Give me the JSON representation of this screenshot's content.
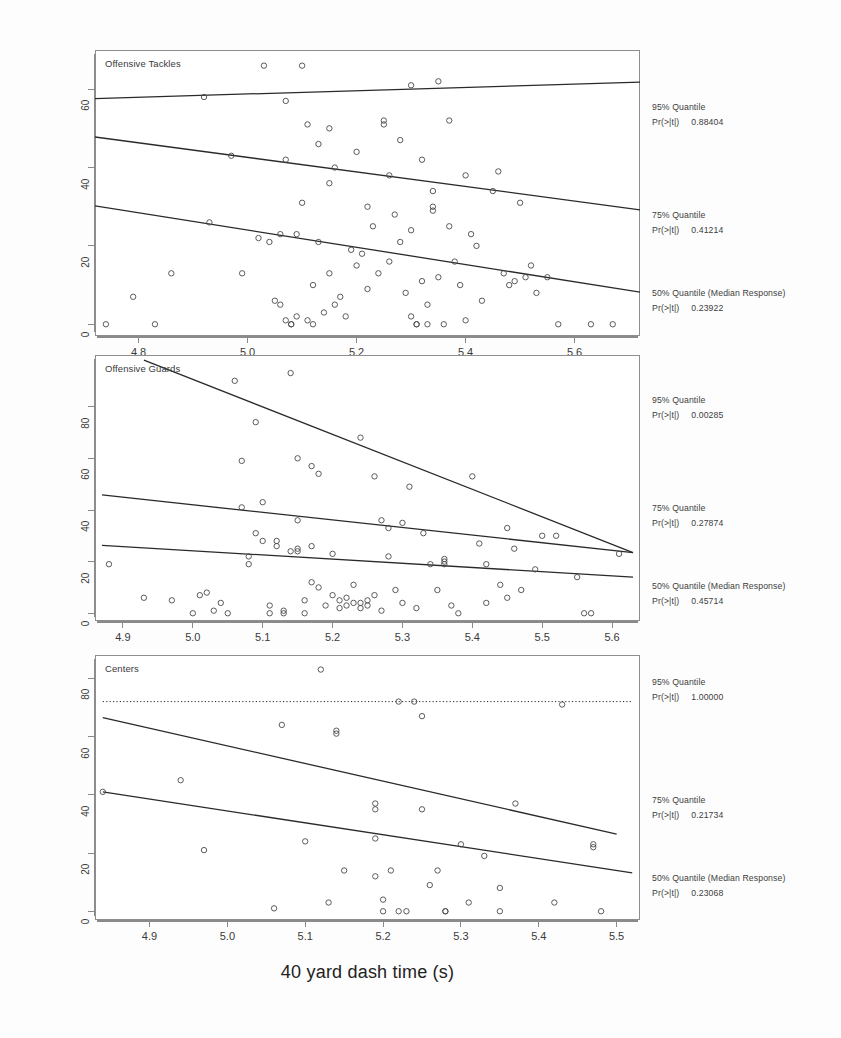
{
  "figure": {
    "xlabel": "40 yard dash time (s)",
    "ylabel": "Career Approximate Value"
  },
  "chart_data": [
    {
      "type": "scatter",
      "title": "Offensive Tackles",
      "xlabel": "40 yard dash time (s)",
      "ylabel": "Career Approximate Value",
      "xlim": [
        4.72,
        5.72
      ],
      "ylim": [
        -3,
        70
      ],
      "xticks": [
        4.8,
        5.0,
        5.2,
        5.4,
        5.6
      ],
      "yticks": [
        0,
        20,
        40,
        60
      ],
      "grid": false,
      "marker": "open-circle",
      "points": [
        [
          4.74,
          0
        ],
        [
          4.79,
          7
        ],
        [
          4.83,
          0
        ],
        [
          4.86,
          13
        ],
        [
          4.92,
          58
        ],
        [
          4.93,
          26
        ],
        [
          4.97,
          43
        ],
        [
          4.99,
          13
        ],
        [
          5.02,
          22
        ],
        [
          5.03,
          66
        ],
        [
          5.04,
          21
        ],
        [
          5.05,
          6
        ],
        [
          5.06,
          5
        ],
        [
          5.06,
          23
        ],
        [
          5.07,
          57
        ],
        [
          5.07,
          42
        ],
        [
          5.07,
          1
        ],
        [
          5.08,
          0
        ],
        [
          5.08,
          0
        ],
        [
          5.09,
          23
        ],
        [
          5.09,
          2
        ],
        [
          5.1,
          66
        ],
        [
          5.1,
          31
        ],
        [
          5.11,
          51
        ],
        [
          5.11,
          1
        ],
        [
          5.12,
          10
        ],
        [
          5.12,
          0
        ],
        [
          5.13,
          46
        ],
        [
          5.13,
          21
        ],
        [
          5.14,
          3
        ],
        [
          5.15,
          50
        ],
        [
          5.15,
          36
        ],
        [
          5.15,
          13
        ],
        [
          5.16,
          40
        ],
        [
          5.16,
          5
        ],
        [
          5.17,
          7
        ],
        [
          5.18,
          2
        ],
        [
          5.19,
          19
        ],
        [
          5.2,
          44
        ],
        [
          5.2,
          15
        ],
        [
          5.21,
          18
        ],
        [
          5.22,
          30
        ],
        [
          5.22,
          9
        ],
        [
          5.23,
          25
        ],
        [
          5.24,
          13
        ],
        [
          5.25,
          52
        ],
        [
          5.25,
          51
        ],
        [
          5.26,
          38
        ],
        [
          5.26,
          16
        ],
        [
          5.27,
          28
        ],
        [
          5.28,
          47
        ],
        [
          5.28,
          21
        ],
        [
          5.29,
          8
        ],
        [
          5.3,
          61
        ],
        [
          5.3,
          24
        ],
        [
          5.3,
          2
        ],
        [
          5.31,
          0
        ],
        [
          5.31,
          0
        ],
        [
          5.32,
          42
        ],
        [
          5.32,
          11
        ],
        [
          5.33,
          5
        ],
        [
          5.33,
          0
        ],
        [
          5.34,
          34
        ],
        [
          5.34,
          30
        ],
        [
          5.34,
          29
        ],
        [
          5.35,
          62
        ],
        [
          5.35,
          12
        ],
        [
          5.36,
          0
        ],
        [
          5.37,
          52
        ],
        [
          5.37,
          25
        ],
        [
          5.38,
          16
        ],
        [
          5.39,
          10
        ],
        [
          5.4,
          38
        ],
        [
          5.4,
          1
        ],
        [
          5.41,
          23
        ],
        [
          5.42,
          20
        ],
        [
          5.43,
          6
        ],
        [
          5.45,
          34
        ],
        [
          5.46,
          39
        ],
        [
          5.47,
          13
        ],
        [
          5.48,
          10
        ],
        [
          5.49,
          11
        ],
        [
          5.5,
          31
        ],
        [
          5.51,
          12
        ],
        [
          5.52,
          15
        ],
        [
          5.53,
          8
        ],
        [
          5.55,
          12
        ],
        [
          5.57,
          0
        ],
        [
          5.63,
          0
        ],
        [
          5.67,
          0
        ]
      ],
      "fits": [
        {
          "name": "95% Quantile",
          "x0": 4.72,
          "y0": 57.6,
          "x1": 5.72,
          "y1": 61.8,
          "style": "solid"
        },
        {
          "name": "75% Quantile",
          "x0": 4.72,
          "y0": 47.8,
          "x1": 5.72,
          "y1": 29.2,
          "style": "solid"
        },
        {
          "name": "50% Quantile (Median Response)",
          "x0": 4.72,
          "y0": 30.2,
          "x1": 5.72,
          "y1": 8.2,
          "style": "solid"
        }
      ],
      "annotations": [
        {
          "quantile": "95% Quantile",
          "stat_label": "Pr(>|t|)",
          "p_value": "0.88404"
        },
        {
          "quantile": "75% Quantile",
          "stat_label": "Pr(>|t|)",
          "p_value": "0.41214"
        },
        {
          "quantile": "50% Quantile (Median Response)",
          "stat_label": "Pr(>|t|)",
          "p_value": "0.23922"
        }
      ]
    },
    {
      "type": "scatter",
      "title": "Offensive Guards",
      "xlabel": "40 yard dash time (s)",
      "ylabel": "Career Approximate Value",
      "xlim": [
        4.86,
        5.64
      ],
      "ylim": [
        -3,
        100
      ],
      "xticks": [
        4.9,
        5.0,
        5.1,
        5.2,
        5.3,
        5.4,
        5.5,
        5.6
      ],
      "yticks": [
        0,
        20,
        40,
        60,
        80
      ],
      "grid": false,
      "marker": "open-circle",
      "points": [
        [
          4.88,
          19
        ],
        [
          4.93,
          6
        ],
        [
          4.97,
          5
        ],
        [
          5.0,
          0
        ],
        [
          5.01,
          7
        ],
        [
          5.02,
          8
        ],
        [
          5.03,
          1
        ],
        [
          5.04,
          4
        ],
        [
          5.05,
          0
        ],
        [
          5.06,
          90
        ],
        [
          5.07,
          59
        ],
        [
          5.07,
          41
        ],
        [
          5.08,
          22
        ],
        [
          5.08,
          19
        ],
        [
          5.09,
          74
        ],
        [
          5.09,
          31
        ],
        [
          5.1,
          43
        ],
        [
          5.1,
          28
        ],
        [
          5.11,
          3
        ],
        [
          5.11,
          0
        ],
        [
          5.12,
          28
        ],
        [
          5.12,
          26
        ],
        [
          5.13,
          1
        ],
        [
          5.13,
          0
        ],
        [
          5.14,
          93
        ],
        [
          5.14,
          24
        ],
        [
          5.15,
          60
        ],
        [
          5.15,
          36
        ],
        [
          5.15,
          25
        ],
        [
          5.15,
          24
        ],
        [
          5.16,
          5
        ],
        [
          5.16,
          0
        ],
        [
          5.17,
          57
        ],
        [
          5.17,
          26
        ],
        [
          5.17,
          12
        ],
        [
          5.18,
          54
        ],
        [
          5.18,
          10
        ],
        [
          5.19,
          3
        ],
        [
          5.2,
          23
        ],
        [
          5.2,
          7
        ],
        [
          5.21,
          5
        ],
        [
          5.21,
          2
        ],
        [
          5.22,
          6
        ],
        [
          5.22,
          3
        ],
        [
          5.23,
          11
        ],
        [
          5.23,
          4
        ],
        [
          5.24,
          68
        ],
        [
          5.24,
          4
        ],
        [
          5.24,
          2
        ],
        [
          5.25,
          5
        ],
        [
          5.25,
          3
        ],
        [
          5.26,
          53
        ],
        [
          5.26,
          7
        ],
        [
          5.27,
          36
        ],
        [
          5.27,
          1
        ],
        [
          5.28,
          33
        ],
        [
          5.28,
          22
        ],
        [
          5.29,
          9
        ],
        [
          5.3,
          35
        ],
        [
          5.3,
          4
        ],
        [
          5.31,
          49
        ],
        [
          5.32,
          2
        ],
        [
          5.33,
          31
        ],
        [
          5.34,
          19
        ],
        [
          5.35,
          9
        ],
        [
          5.36,
          21
        ],
        [
          5.36,
          20
        ],
        [
          5.36,
          19
        ],
        [
          5.37,
          3
        ],
        [
          5.38,
          0
        ],
        [
          5.4,
          53
        ],
        [
          5.41,
          27
        ],
        [
          5.42,
          19
        ],
        [
          5.42,
          4
        ],
        [
          5.44,
          11
        ],
        [
          5.45,
          33
        ],
        [
          5.45,
          6
        ],
        [
          5.46,
          25
        ],
        [
          5.47,
          9
        ],
        [
          5.49,
          17
        ],
        [
          5.5,
          30
        ],
        [
          5.52,
          30
        ],
        [
          5.55,
          14
        ],
        [
          5.56,
          0
        ],
        [
          5.57,
          0
        ],
        [
          5.61,
          23
        ]
      ],
      "fits": [
        {
          "name": "95% Quantile",
          "x0": 4.93,
          "y0": 98,
          "x1": 5.63,
          "y1": 23.5,
          "style": "solid"
        },
        {
          "name": "75% Quantile",
          "x0": 4.87,
          "y0": 45.8,
          "x1": 5.63,
          "y1": 23.5,
          "style": "solid"
        },
        {
          "name": "50% Quantile (Median Response)",
          "x0": 4.87,
          "y0": 26.3,
          "x1": 5.63,
          "y1": 14.0,
          "style": "solid"
        }
      ],
      "annotations": [
        {
          "quantile": "95% Quantile",
          "stat_label": "Pr(>|t|)",
          "p_value": "0.00285"
        },
        {
          "quantile": "75% Quantile",
          "stat_label": "Pr(>|t|)",
          "p_value": "0.27874"
        },
        {
          "quantile": "50% Quantile (Median Response)",
          "stat_label": "Pr(>|t|)",
          "p_value": "0.45714"
        }
      ]
    },
    {
      "type": "scatter",
      "title": "Centers",
      "xlabel": "40 yard dash time (s)",
      "ylabel": "Career Approximate Value",
      "xlim": [
        4.83,
        5.53
      ],
      "ylim": [
        -3,
        88
      ],
      "xticks": [
        4.9,
        5.0,
        5.1,
        5.2,
        5.3,
        5.4,
        5.5
      ],
      "yticks": [
        0,
        20,
        40,
        60,
        80
      ],
      "grid": false,
      "marker": "open-circle",
      "points": [
        [
          4.84,
          41
        ],
        [
          4.94,
          45
        ],
        [
          4.97,
          21
        ],
        [
          5.06,
          1
        ],
        [
          5.07,
          64
        ],
        [
          5.1,
          24
        ],
        [
          5.12,
          83
        ],
        [
          5.13,
          3
        ],
        [
          5.14,
          62
        ],
        [
          5.14,
          61
        ],
        [
          5.15,
          14
        ],
        [
          5.19,
          37
        ],
        [
          5.19,
          35
        ],
        [
          5.19,
          25
        ],
        [
          5.19,
          12
        ],
        [
          5.2,
          4
        ],
        [
          5.2,
          0
        ],
        [
          5.21,
          14
        ],
        [
          5.22,
          72
        ],
        [
          5.22,
          0
        ],
        [
          5.23,
          0
        ],
        [
          5.24,
          72
        ],
        [
          5.25,
          67
        ],
        [
          5.25,
          35
        ],
        [
          5.26,
          9
        ],
        [
          5.27,
          14
        ],
        [
          5.28,
          0
        ],
        [
          5.28,
          0
        ],
        [
          5.3,
          23
        ],
        [
          5.31,
          3
        ],
        [
          5.33,
          19
        ],
        [
          5.35,
          8
        ],
        [
          5.35,
          0
        ],
        [
          5.37,
          37
        ],
        [
          5.42,
          3
        ],
        [
          5.43,
          71
        ],
        [
          5.47,
          23
        ],
        [
          5.47,
          22
        ],
        [
          5.48,
          0
        ]
      ],
      "fits": [
        {
          "name": "95% Quantile",
          "x0": 4.84,
          "y0": 72,
          "x1": 5.52,
          "y1": 72,
          "style": "dotted"
        },
        {
          "name": "75% Quantile",
          "x0": 4.84,
          "y0": 66.5,
          "x1": 5.5,
          "y1": 26.5,
          "style": "solid"
        },
        {
          "name": "50% Quantile (Median Response)",
          "x0": 4.84,
          "y0": 41,
          "x1": 5.52,
          "y1": 13.2,
          "style": "solid"
        }
      ],
      "annotations": [
        {
          "quantile": "95% Quantile",
          "stat_label": "Pr(>|t|)",
          "p_value": "1.00000"
        },
        {
          "quantile": "75% Quantile",
          "stat_label": "Pr(>|t|)",
          "p_value": "0.21734"
        },
        {
          "quantile": "50% Quantile (Median Response)",
          "stat_label": "Pr(>|t|)",
          "p_value": "0.23068"
        }
      ]
    }
  ]
}
